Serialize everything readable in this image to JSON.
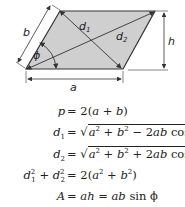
{
  "diagram": {
    "shape": "parallelogram",
    "fill_color": "#cfcfcf",
    "stroke_color": "#333333",
    "labels": {
      "side_b": "b",
      "base_a": "a",
      "height_h": "h",
      "diagonal_1": "d",
      "diagonal_1_sub": "1",
      "diagonal_2": "d",
      "diagonal_2_sub": "2",
      "angle": "ϕ"
    }
  },
  "formulas": [
    {
      "lhs": "p",
      "rhs": "= 2(a + b)"
    },
    {
      "lhs": "d₁",
      "rhs": "= √(a² + b² − 2ab cos ϕ)"
    },
    {
      "lhs": "d₂",
      "rhs": "= √(a² + b² + 2ab cos ϕ)"
    },
    {
      "lhs": "d₁² + d₂²",
      "rhs": "= 2(a² + b²)"
    },
    {
      "lhs": "A",
      "rhs": "= ah = ab sin ϕ"
    }
  ],
  "formula_parts": {
    "p": "p",
    "eq": "=",
    "two": "2",
    "open": "(",
    "close": ")",
    "plus": "+",
    "minus": "−",
    "a": "a",
    "b": "b",
    "h": "h",
    "A": "A",
    "d": "d",
    "sq": "2",
    "s1": "1",
    "s2": "2",
    "cos": "cos",
    "sin": "sin",
    "phi": "ϕ",
    "ab": "ab",
    "ah": "ah",
    "sqrt": "√"
  }
}
